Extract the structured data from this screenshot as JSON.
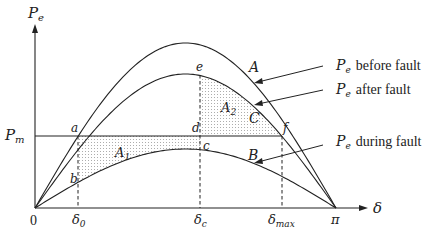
{
  "diagram": {
    "axes": {
      "y_label": "P",
      "y_label_sub": "e",
      "x_label": "δ",
      "origin_label": "0",
      "pm_label": "P",
      "pm_label_sub": "m"
    },
    "x_ticks": [
      {
        "label": "δ",
        "sub": "0",
        "id": "delta0"
      },
      {
        "label": "δ",
        "sub": "c",
        "id": "deltac"
      },
      {
        "label": "δ",
        "sub": "max",
        "id": "deltamax"
      },
      {
        "label": "π",
        "sub": "",
        "id": "pi"
      }
    ],
    "curves": [
      {
        "id": "A",
        "label": "A",
        "legend": "before fault",
        "legend_p": "P",
        "legend_sub": "e"
      },
      {
        "id": "C",
        "label": "C",
        "legend": "after fault",
        "legend_p": "P",
        "legend_sub": "e"
      },
      {
        "id": "B",
        "label": "B",
        "legend": "during fault",
        "legend_p": "P",
        "legend_sub": "e"
      }
    ],
    "points": [
      "a",
      "b",
      "c",
      "d",
      "e",
      "f"
    ],
    "areas": [
      {
        "id": "A1",
        "label": "A",
        "sub": "1"
      },
      {
        "id": "A2",
        "label": "A",
        "sub": "2"
      }
    ]
  }
}
